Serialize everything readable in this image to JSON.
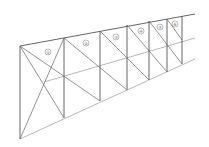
{
  "diagram": {
    "verticals": [
      {
        "x": 20,
        "top": 46,
        "bottom": 139
      },
      {
        "x": 64,
        "top": 38,
        "bottom": 118
      },
      {
        "x": 100,
        "top": 31,
        "bottom": 101
      },
      {
        "x": 127,
        "top": 25,
        "bottom": 90
      },
      {
        "x": 149,
        "top": 21,
        "bottom": 80
      },
      {
        "x": 167,
        "top": 19,
        "bottom": 72
      },
      {
        "x": 182,
        "top": 16,
        "bottom": 64
      }
    ],
    "bays": [
      {
        "label": "①",
        "lx": 48,
        "ly": 52
      },
      {
        "label": "②",
        "lx": 86,
        "ly": 43
      },
      {
        "label": "③",
        "lx": 116,
        "ly": 37
      },
      {
        "label": "④",
        "lx": 141,
        "ly": 31
      },
      {
        "label": "⑤",
        "lx": 160,
        "ly": 27
      },
      {
        "label": "⑥",
        "lx": 175,
        "ly": 24
      }
    ],
    "colors": {
      "line": "#555555",
      "background": "#ffffff"
    }
  }
}
